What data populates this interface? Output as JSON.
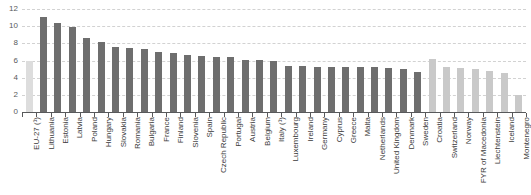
{
  "chart_data": {
    "type": "bar",
    "title": "",
    "subtitle": "",
    "xlabel": "",
    "ylabel": "",
    "ylim": [
      0,
      12
    ],
    "ytick_values": [
      0,
      2,
      4,
      6,
      8,
      10,
      12
    ],
    "ytick_labels": [
      "0",
      "2",
      "4",
      "6",
      "8",
      "10",
      "12"
    ],
    "grid": true,
    "legend_position": "none",
    "categories": [
      "EU-27 (¹)",
      "Lithuania",
      "Estonia",
      "Latvia",
      "Poland",
      "Hungary",
      "Slovakia",
      "Romania",
      "Bulgaria",
      "France",
      "Finland",
      "Slovenia",
      "Spain",
      "Czech Republic",
      "Portugal",
      "Austria",
      "Belgium",
      "Italy (¹)",
      "Luxembourg",
      "Ireland",
      "Germany",
      "Cyprus",
      "Greece",
      "Malta",
      "Netherlands",
      "United Kingdom",
      "Denmark",
      "Sweden",
      "Croatia",
      "Switzerland",
      "Norway",
      "FYR of Macedonia",
      "Liechtenstein",
      "Iceland",
      "Montenegro"
    ],
    "values": [
      6.0,
      11.1,
      10.4,
      9.9,
      8.6,
      8.1,
      7.6,
      7.5,
      7.3,
      7.0,
      6.9,
      6.6,
      6.5,
      6.4,
      6.4,
      6.1,
      6.1,
      5.9,
      5.4,
      5.4,
      5.3,
      5.3,
      5.2,
      5.2,
      5.2,
      5.1,
      5.0,
      4.7,
      6.2,
      5.3,
      5.1,
      5.0,
      4.8,
      4.6,
      2.0
    ],
    "series_kinds": [
      "aggregate",
      "member",
      "member",
      "member",
      "member",
      "member",
      "member",
      "member",
      "member",
      "member",
      "member",
      "member",
      "member",
      "member",
      "member",
      "member",
      "member",
      "member",
      "member",
      "member",
      "member",
      "member",
      "member",
      "member",
      "member",
      "member",
      "member",
      "member",
      "nonmember",
      "nonmember",
      "nonmember",
      "nonmember",
      "nonmember",
      "nonmember",
      "nonmember"
    ],
    "colors": {
      "aggregate": "#dddddd",
      "member": "#6e6e6e",
      "nonmember": "#c9c9c9",
      "gridline": "#d2d2d2",
      "axis": "#58595b",
      "label": "#3b3b3b",
      "background": "#ffffff"
    }
  }
}
